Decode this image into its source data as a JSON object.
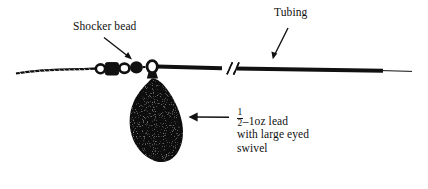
{
  "figure": {
    "background_color": "#ffffff",
    "ink_color": "#111111",
    "width": 428,
    "height": 189
  },
  "labels": {
    "shocker_bead": "Shocker bead",
    "tubing": "Tubing",
    "lead_fraction_numerator": "1",
    "lead_fraction_denominator": "2",
    "lead_line1_suffix": "–1oz lead",
    "lead_line2": "with large eyed",
    "lead_line3": "swivel"
  },
  "components": {
    "braided_line": "braided-line",
    "swivel_ring_left": "swivel-ring",
    "square_bead": "square-shocker-bead",
    "middle_ring": "ring-bead",
    "round_bead": "round-shocker-bead",
    "eyed_swivel_ring": "eyed-swivel-ring",
    "lead_weight": "pear-lead-weight",
    "tubing_line": "tubing",
    "break_marks": "line-break-marks",
    "tail_line": "thin-tail-line"
  },
  "arrows": {
    "shocker_bead_arrow": "arrow-to-shocker-bead",
    "tubing_arrow": "arrow-to-tubing",
    "lead_arrow": "arrow-to-lead"
  }
}
